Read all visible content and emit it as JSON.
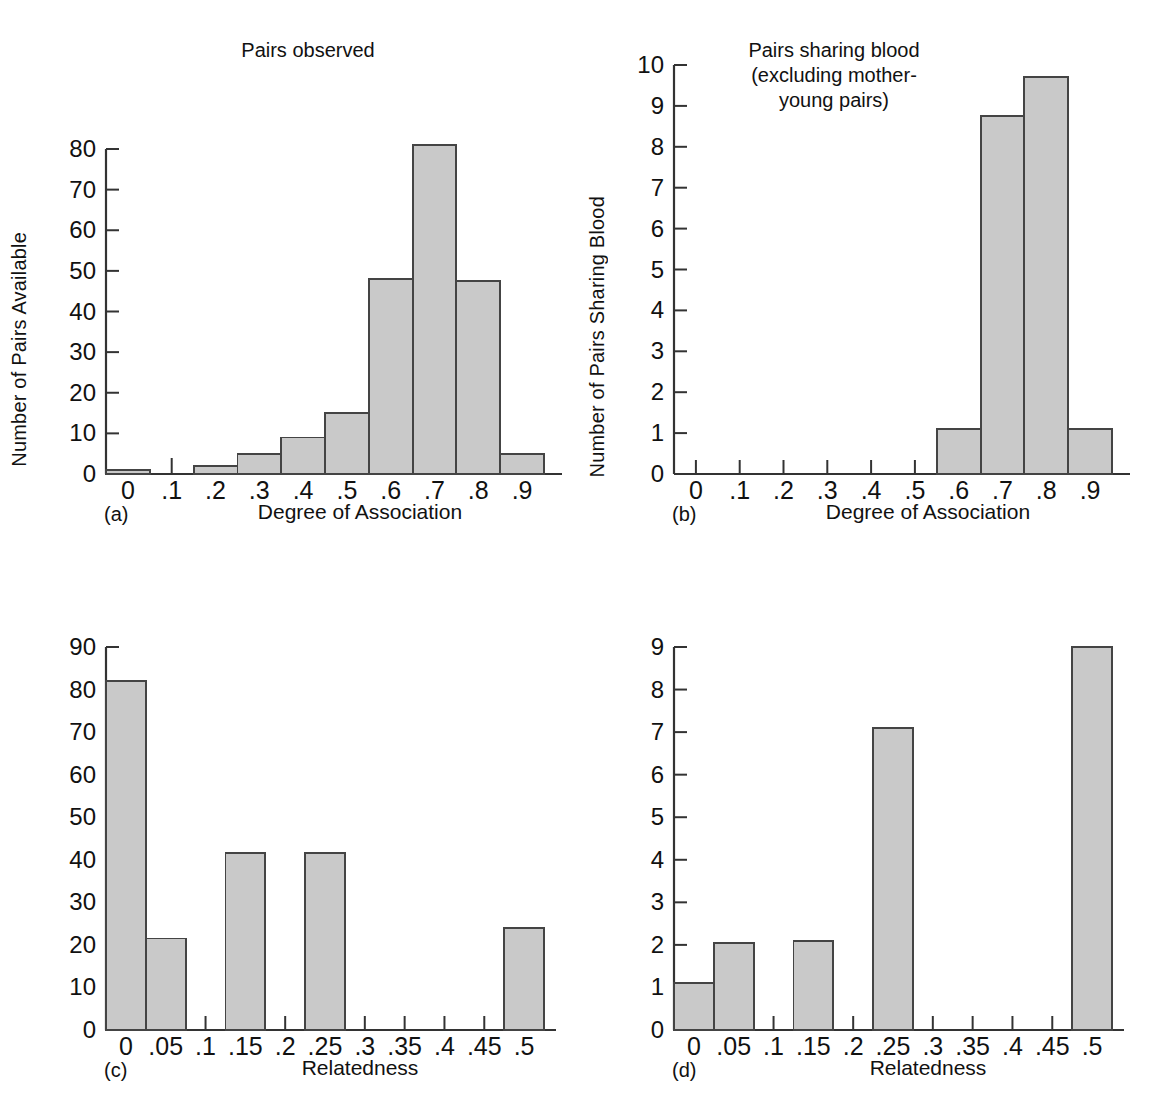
{
  "figure": {
    "axis_label_left": "Number of Pairs Available",
    "axis_label_right": "Number of Pairs Sharing Blood",
    "bar_fill": "#c9c9c9",
    "bar_stroke": "#444444",
    "axis_color": "#333333"
  },
  "panels": [
    {
      "tag": "(a)",
      "title": "Pairs observed",
      "xlabel": "Degree of Association",
      "ylabel": "Number of Pairs Available",
      "xticks": [
        "0",
        ".1",
        ".2",
        ".3",
        ".4",
        ".5",
        ".6",
        ".7",
        ".8",
        ".9"
      ],
      "yticks": [
        "0",
        "10",
        "20",
        "30",
        "40",
        "50",
        "60",
        "70",
        "80"
      ]
    },
    {
      "tag": "(b)",
      "title": "Pairs sharing blood\n(excluding mother-\nyoung pairs)",
      "xlabel": "Degree of Association",
      "ylabel": "Number of Pairs Sharing Blood",
      "xticks": [
        "0",
        ".1",
        ".2",
        ".3",
        ".4",
        ".5",
        ".6",
        ".7",
        ".8",
        ".9"
      ],
      "yticks": [
        "0",
        "1",
        "2",
        "3",
        "4",
        "5",
        "6",
        "7",
        "8",
        "9",
        "10"
      ]
    },
    {
      "tag": "(c)",
      "title": "",
      "xlabel": "Relatedness",
      "ylabel": "Number of Pairs Available",
      "xticks": [
        "0",
        ".05",
        ".1",
        ".15",
        ".2",
        ".25",
        ".3",
        ".35",
        ".4",
        ".45",
        ".5"
      ],
      "yticks": [
        "0",
        "10",
        "20",
        "30",
        "40",
        "50",
        "60",
        "70",
        "80",
        "90"
      ]
    },
    {
      "tag": "(d)",
      "title": "",
      "xlabel": "Relatedness",
      "ylabel": "Number of Pairs Sharing Blood",
      "xticks": [
        "0",
        ".05",
        ".1",
        ".15",
        ".2",
        ".25",
        ".3",
        ".35",
        ".4",
        ".45",
        ".5"
      ],
      "yticks": [
        "0",
        "1",
        "2",
        "3",
        "4",
        "5",
        "6",
        "7",
        "8",
        "9"
      ]
    }
  ],
  "chart_data": [
    {
      "type": "bar",
      "panel": "(a)",
      "title": "Pairs observed",
      "xlabel": "Degree of Association",
      "ylabel": "Number of Pairs Available",
      "categories": [
        "0",
        ".1",
        ".2",
        ".3",
        ".4",
        ".5",
        ".6",
        ".7",
        ".8",
        ".9"
      ],
      "values": [
        1,
        0,
        2,
        5,
        9,
        15,
        48,
        81,
        47.5,
        5
      ],
      "ylim": [
        0,
        80
      ],
      "ytick_step": 10,
      "grid": false,
      "legend": "none"
    },
    {
      "type": "bar",
      "panel": "(b)",
      "title": "Pairs sharing blood (excluding mother-young pairs)",
      "xlabel": "Degree of Association",
      "ylabel": "Number of Pairs Sharing Blood",
      "categories": [
        "0",
        ".1",
        ".2",
        ".3",
        ".4",
        ".5",
        ".6",
        ".7",
        ".8",
        ".9"
      ],
      "values": [
        0,
        0,
        0,
        0,
        0,
        0,
        1.1,
        8.75,
        9.7,
        1.1
      ],
      "ylim": [
        0,
        10
      ],
      "ytick_step": 1,
      "grid": false,
      "legend": "none"
    },
    {
      "type": "bar",
      "panel": "(c)",
      "title": "",
      "xlabel": "Relatedness",
      "ylabel": "Number of Pairs Available",
      "categories": [
        "0",
        ".05",
        ".1",
        ".15",
        ".2",
        ".25",
        ".3",
        ".35",
        ".4",
        ".45",
        ".5"
      ],
      "values": [
        82,
        21.5,
        0,
        41.5,
        0,
        41.5,
        0,
        0,
        0,
        0,
        24
      ],
      "ylim": [
        0,
        90
      ],
      "ytick_step": 10,
      "grid": false,
      "legend": "none"
    },
    {
      "type": "bar",
      "panel": "(d)",
      "title": "",
      "xlabel": "Relatedness",
      "ylabel": "Number of Pairs Sharing Blood",
      "categories": [
        "0",
        ".05",
        ".1",
        ".15",
        ".2",
        ".25",
        ".3",
        ".35",
        ".4",
        ".45",
        ".5"
      ],
      "values": [
        1.1,
        2.05,
        0,
        2.1,
        0,
        7.1,
        0,
        0,
        0,
        0,
        9
      ],
      "ylim": [
        0,
        9
      ],
      "ytick_step": 1,
      "grid": false,
      "legend": "none"
    }
  ]
}
